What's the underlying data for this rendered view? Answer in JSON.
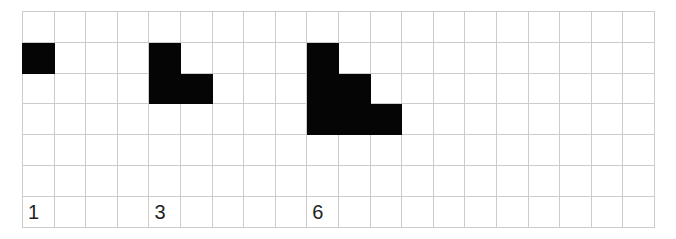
{
  "figure": {
    "kind": "grid-pattern-sequence",
    "description": "Growing staircase pattern drawn on a square grid",
    "background_color": "#ffffff",
    "grid_line_color": "#cccccc",
    "filled_cell_color": "#050505"
  },
  "grid": {
    "columns": 20,
    "rows": 7,
    "cell_width_px": 31.6,
    "cell_height_px": 30.8
  },
  "labels": [
    {
      "text": "1",
      "row": 6,
      "col": 0
    },
    {
      "text": "3",
      "row": 6,
      "col": 4
    },
    {
      "text": "6",
      "row": 6,
      "col": 9
    }
  ],
  "shapes": [
    {
      "name": "term-1",
      "label": "1",
      "count": 1,
      "cells": [
        [
          1,
          0
        ]
      ]
    },
    {
      "name": "term-2",
      "label": "3",
      "count": 3,
      "cells": [
        [
          1,
          4
        ],
        [
          2,
          4
        ],
        [
          2,
          5
        ]
      ]
    },
    {
      "name": "term-3",
      "label": "6",
      "count": 6,
      "cells": [
        [
          1,
          9
        ],
        [
          2,
          9
        ],
        [
          2,
          10
        ],
        [
          3,
          9
        ],
        [
          3,
          10
        ],
        [
          3,
          11
        ]
      ]
    }
  ],
  "chart_data": {
    "type": "bar",
    "title": "",
    "xlabel": "",
    "ylabel": "",
    "categories": [
      "1",
      "3",
      "6"
    ],
    "values": [
      1,
      3,
      6
    ],
    "annotations": [
      "triangular numbers 1, 3, 6 shown as staircases of unit squares"
    ]
  }
}
